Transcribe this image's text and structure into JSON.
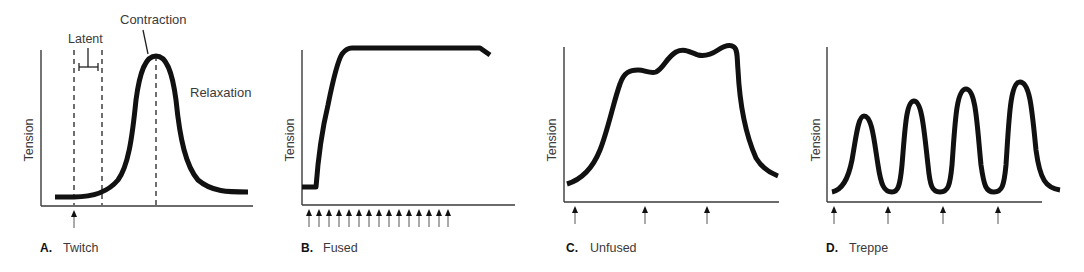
{
  "figure": {
    "panels": [
      {
        "id": "A",
        "letter": "A.",
        "title": "Twitch",
        "ylabel": "Tension",
        "annotations": {
          "latent": "Latent",
          "contraction": "Contraction",
          "relaxation": "Relaxation"
        },
        "stimuli_count": 1
      },
      {
        "id": "B",
        "letter": "B.",
        "title": "Fused",
        "ylabel": "Tension",
        "stimuli_count": 15
      },
      {
        "id": "C",
        "letter": "C.",
        "title": "Unfused",
        "ylabel": "Tension",
        "stimuli_count": 3
      },
      {
        "id": "D",
        "letter": "D.",
        "title": "Treppe",
        "ylabel": "Tension",
        "stimuli_count": 4
      }
    ],
    "colors": {
      "curve": "#111111",
      "axis": "#3a3a3a",
      "text": "#3a3a3a"
    }
  }
}
